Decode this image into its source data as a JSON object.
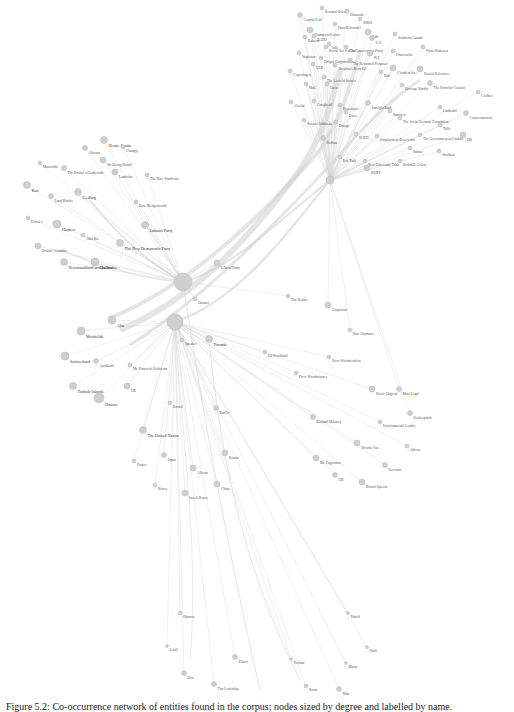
{
  "figure": {
    "caption": "Figure 5.2: Co-occurrence network of entities found in the corpus; nodes sized by degree and labelled by name."
  },
  "chart_data": {
    "type": "network",
    "title": "",
    "hubs": [
      {
        "id": "hub1",
        "x": 183,
        "y": 282,
        "r": 9
      },
      {
        "id": "hub2",
        "x": 175,
        "y": 322,
        "r": 8
      },
      {
        "id": "hub3",
        "x": 330,
        "y": 180,
        "r": 4
      }
    ],
    "nodes": [
      {
        "label": "Bernard Orlenz",
        "x": 322,
        "y": 8,
        "r": 2
      },
      {
        "label": "Diamond",
        "x": 347,
        "y": 11,
        "r": 2
      },
      {
        "label": "Comtnt Feld",
        "x": 300,
        "y": 15,
        "r": 2.5
      },
      {
        "label": "SNOS",
        "x": 360,
        "y": 19,
        "r": 2
      },
      {
        "label": "Omn Belvander",
        "x": 335,
        "y": 24,
        "r": 2
      },
      {
        "label": "Champion Person",
        "x": 310,
        "y": 30,
        "r": 3
      },
      {
        "label": "Rdlt",
        "x": 368,
        "y": 32,
        "r": 3
      },
      {
        "label": "Southern Canada",
        "x": 395,
        "y": 34,
        "r": 2
      },
      {
        "label": "NATO",
        "x": 314,
        "y": 36,
        "r": 2
      },
      {
        "label": "Raheim",
        "x": 305,
        "y": 37,
        "r": 2
      },
      {
        "label": "U.S.",
        "x": 372,
        "y": 38,
        "r": 2.5
      },
      {
        "label": "Inhl",
        "x": 329,
        "y": 44,
        "r": 2
      },
      {
        "label": "Social Sec 9 to Sal",
        "x": 326,
        "y": 47,
        "r": 2
      },
      {
        "label": "The Conservative Party",
        "x": 346,
        "y": 47,
        "r": 2
      },
      {
        "label": "Fram Blakenen",
        "x": 423,
        "y": 47,
        "r": 2
      },
      {
        "label": "Francouche",
        "x": 393,
        "y": 51,
        "r": 2
      },
      {
        "label": "Stapleton",
        "x": 299,
        "y": 53,
        "r": 2
      },
      {
        "label": "N.E.",
        "x": 370,
        "y": 53,
        "r": 3
      },
      {
        "label": "Unipol Corporations",
        "x": 321,
        "y": 58,
        "r": 2
      },
      {
        "label": "The Reformed Proposer",
        "x": 350,
        "y": 60,
        "r": 2
      },
      {
        "label": "UEB",
        "x": 313,
        "y": 64,
        "r": 2
      },
      {
        "label": "Shephaset Berryhill",
        "x": 335,
        "y": 65,
        "r": 2
      },
      {
        "label": "Cloudent Inc.",
        "x": 393,
        "y": 68,
        "r": 3
      },
      {
        "label": "United Reference",
        "x": 420,
        "y": 69,
        "r": 3
      },
      {
        "label": "Copenhagen",
        "x": 290,
        "y": 71,
        "r": 2
      },
      {
        "label": "The Liefield Service",
        "x": 324,
        "y": 77,
        "r": 2
      },
      {
        "label": "Rdd",
        "x": 381,
        "y": 72,
        "r": 2
      },
      {
        "label": "Mall",
        "x": 306,
        "y": 84,
        "r": 2
      },
      {
        "label": "Unix",
        "x": 327,
        "y": 84,
        "r": 2
      },
      {
        "label": "Orvenge Bardin",
        "x": 402,
        "y": 85,
        "r": 2
      },
      {
        "label": "The Portfolio Council",
        "x": 430,
        "y": 83,
        "r": 2.5
      },
      {
        "label": "Cledbes",
        "x": 478,
        "y": 92,
        "r": 2
      },
      {
        "label": "Alcolat",
        "x": 291,
        "y": 102,
        "r": 2
      },
      {
        "label": "Craighead",
        "x": 314,
        "y": 101,
        "r": 2
      },
      {
        "label": "Benenopol",
        "x": 340,
        "y": 105,
        "r": 2
      },
      {
        "label": "Sunlight Rudt",
        "x": 368,
        "y": 103,
        "r": 2.5
      },
      {
        "label": "Lindaahd",
        "x": 440,
        "y": 107,
        "r": 2
      },
      {
        "label": "Esten",
        "x": 346,
        "y": 112,
        "r": 2
      },
      {
        "label": "Starview",
        "x": 390,
        "y": 111,
        "r": 2
      },
      {
        "label": "Conservationist",
        "x": 466,
        "y": 113,
        "r": 2.5
      },
      {
        "label": "Seusset Outbreak",
        "x": 304,
        "y": 120,
        "r": 2
      },
      {
        "label": "Orange",
        "x": 336,
        "y": 122,
        "r": 2
      },
      {
        "label": "The Social Security Foundation",
        "x": 400,
        "y": 118,
        "r": 2
      },
      {
        "label": "Tiflit",
        "x": 440,
        "y": 125,
        "r": 2
      },
      {
        "label": "NATO",
        "x": 356,
        "y": 134,
        "r": 2
      },
      {
        "label": "Employment Reservoirs",
        "x": 377,
        "y": 136,
        "r": 2
      },
      {
        "label": "The Government of Canada",
        "x": 420,
        "y": 135,
        "r": 2
      },
      {
        "label": "OK",
        "x": 463,
        "y": 135,
        "r": 3
      },
      {
        "label": "Bedlan",
        "x": 323,
        "y": 138,
        "r": 2.5
      },
      {
        "label": "Sutton",
        "x": 410,
        "y": 148,
        "r": 2
      },
      {
        "label": "Sandsten",
        "x": 439,
        "y": 151,
        "r": 2
      },
      {
        "label": "Esx Turk",
        "x": 340,
        "y": 157,
        "r": 2
      },
      {
        "label": "New University Table",
        "x": 365,
        "y": 161,
        "r": 2
      },
      {
        "label": "Richmill Coleur",
        "x": 400,
        "y": 161,
        "r": 2
      },
      {
        "label": "BURY",
        "x": 367,
        "y": 168,
        "r": 3
      },
      {
        "label": "Albeton",
        "x": 85,
        "y": 148,
        "r": 2.5
      },
      {
        "label": "Henne Scotta",
        "x": 104,
        "y": 140,
        "r": 3.5
      },
      {
        "label": "Changly",
        "x": 123,
        "y": 147,
        "r": 2
      },
      {
        "label": "Manifolds",
        "x": 40,
        "y": 163,
        "r": 2
      },
      {
        "label": "Wellbeing Board",
        "x": 103,
        "y": 160,
        "r": 3
      },
      {
        "label": "The Bristol of Lutherside",
        "x": 64,
        "y": 168,
        "r": 2.5
      },
      {
        "label": "Landolan",
        "x": 115,
        "y": 172,
        "r": 3
      },
      {
        "label": "The Blue Syndrome",
        "x": 147,
        "y": 175,
        "r": 2
      },
      {
        "label": "Kan",
        "x": 27,
        "y": 185,
        "r": 3.5
      },
      {
        "label": "Land Blacks",
        "x": 51,
        "y": 196,
        "r": 2.5
      },
      {
        "label": "Gedlarg",
        "x": 78,
        "y": 192,
        "r": 3.5
      },
      {
        "label": "Erne Bledgerworth",
        "x": 136,
        "y": 202,
        "r": 2
      },
      {
        "label": "Ernest 1",
        "x": 28,
        "y": 218,
        "r": 2
      },
      {
        "label": "Harpers",
        "x": 57,
        "y": 224,
        "r": 4
      },
      {
        "label": "Labourl Party",
        "x": 145,
        "y": 225,
        "r": 3.5
      },
      {
        "label": "Albu Ba",
        "x": 83,
        "y": 235,
        "r": 2
      },
      {
        "label": "British Columbia",
        "x": 38,
        "y": 246,
        "r": 3
      },
      {
        "label": "The New Democratic Party",
        "x": 120,
        "y": 243,
        "r": 3.5
      },
      {
        "label": "Newfoundland and Labrador",
        "x": 64,
        "y": 262,
        "r": 3.5
      },
      {
        "label": "Quebec",
        "x": 95,
        "y": 262,
        "r": 4
      },
      {
        "label": "Liberal Party",
        "x": 217,
        "y": 263,
        "r": 3
      },
      {
        "label": "Ontario",
        "x": 195,
        "y": 299,
        "r": 2
      },
      {
        "label": "Alta",
        "x": 112,
        "y": 320,
        "r": 4
      },
      {
        "label": "Mettfields",
        "x": 81,
        "y": 331,
        "r": 4
      },
      {
        "label": "Speaker",
        "x": 182,
        "y": 340,
        "r": 2
      },
      {
        "label": "Toronto",
        "x": 209,
        "y": 339,
        "r": 3.5
      },
      {
        "label": "Switzerland",
        "x": 65,
        "y": 356,
        "r": 4
      },
      {
        "label": "Auckland",
        "x": 96,
        "y": 361,
        "r": 2.5
      },
      {
        "label": "Mr. Financial Politician",
        "x": 130,
        "y": 365,
        "r": 2
      },
      {
        "label": "Turkish Islands",
        "x": 73,
        "y": 386,
        "r": 3.5
      },
      {
        "label": "UK",
        "x": 127,
        "y": 386,
        "r": 3
      },
      {
        "label": "Ottawa",
        "x": 99,
        "y": 398,
        "r": 5
      },
      {
        "label": "Bristol",
        "x": 170,
        "y": 403,
        "r": 2
      },
      {
        "label": "BarTer",
        "x": 216,
        "y": 408,
        "r": 2.5
      },
      {
        "label": "The United Nation",
        "x": 143,
        "y": 430,
        "r": 3.5
      },
      {
        "label": "France",
        "x": 134,
        "y": 461,
        "r": 2
      },
      {
        "label": "Japan",
        "x": 164,
        "y": 455,
        "r": 2.5
      },
      {
        "label": "Alberta",
        "x": 193,
        "y": 468,
        "r": 3
      },
      {
        "label": "Russia",
        "x": 225,
        "y": 453,
        "r": 3
      },
      {
        "label": "China",
        "x": 217,
        "y": 484,
        "r": 3
      },
      {
        "label": "Korea",
        "x": 155,
        "y": 485,
        "r": 2
      },
      {
        "label": "Israeli Korea",
        "x": 185,
        "y": 493,
        "r": 3
      },
      {
        "label": "The Reader",
        "x": 288,
        "y": 296,
        "r": 2
      },
      {
        "label": "Grapefruit",
        "x": 328,
        "y": 305,
        "r": 3
      },
      {
        "label": "Baie Dunmore",
        "x": 350,
        "y": 330,
        "r": 2
      },
      {
        "label": "Ed Woodland",
        "x": 265,
        "y": 352,
        "r": 2
      },
      {
        "label": "Dove Woodworkers",
        "x": 329,
        "y": 357,
        "r": 2
      },
      {
        "label": "Dove Woodminster",
        "x": 296,
        "y": 373,
        "r": 2
      },
      {
        "label": "Dovie Ungeral",
        "x": 372,
        "y": 389,
        "r": 3
      },
      {
        "label": "Mart Logal",
        "x": 399,
        "y": 389,
        "r": 2.5
      },
      {
        "label": "Richard Maloney",
        "x": 313,
        "y": 417,
        "r": 2.5
      },
      {
        "label": "Zookerplash",
        "x": 410,
        "y": 413,
        "r": 2.5
      },
      {
        "label": "Environmental Lender",
        "x": 380,
        "y": 422,
        "r": 2
      },
      {
        "label": "Athens",
        "x": 407,
        "y": 446,
        "r": 2
      },
      {
        "label": "Trisetta Van",
        "x": 357,
        "y": 443,
        "r": 3
      },
      {
        "label": "Mr. Fagnotton",
        "x": 316,
        "y": 458,
        "r": 3
      },
      {
        "label": "Ezecrant",
        "x": 385,
        "y": 465,
        "r": 2.5
      },
      {
        "label": "UB",
        "x": 335,
        "y": 475,
        "r": 2.5
      },
      {
        "label": "Bristol Queens",
        "x": 362,
        "y": 482,
        "r": 3
      },
      {
        "label": "Obrtson",
        "x": 180,
        "y": 613,
        "r": 2
      },
      {
        "label": "Tabolf",
        "x": 348,
        "y": 613,
        "r": 1.5
      },
      {
        "label": "Labill",
        "x": 167,
        "y": 646,
        "r": 1.5
      },
      {
        "label": "Hald",
        "x": 367,
        "y": 647,
        "r": 1.5
      },
      {
        "label": "Ziiters",
        "x": 235,
        "y": 657,
        "r": 2.5
      },
      {
        "label": "Yochad",
        "x": 291,
        "y": 659,
        "r": 1.5
      },
      {
        "label": "Myrae",
        "x": 346,
        "y": 663,
        "r": 1.5
      },
      {
        "label": "Bert",
        "x": 184,
        "y": 673,
        "r": 2.5
      },
      {
        "label": "Tim Lockridge",
        "x": 214,
        "y": 684,
        "r": 2.5
      },
      {
        "label": "Brom",
        "x": 306,
        "y": 686,
        "r": 2
      },
      {
        "label": "Mab",
        "x": 339,
        "y": 689,
        "r": 2.5
      }
    ]
  }
}
